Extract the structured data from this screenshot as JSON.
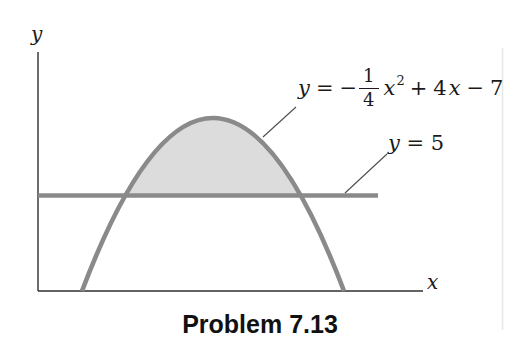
{
  "figure": {
    "caption": "Problem 7.13",
    "axis_labels": {
      "x": "x",
      "y": "y"
    },
    "parabola_label": {
      "lhs": "y",
      "equals": "=",
      "minus": "−",
      "fraction": {
        "numerator": "1",
        "denominator": "4"
      },
      "term_x": "x",
      "exponent": "2",
      "plus": "+",
      "coeff": "4",
      "term_x2": "x",
      "minus2": "−",
      "constant": "7"
    },
    "line_label": {
      "var": "y",
      "rest": " = 5"
    },
    "curves": {
      "parabola_equation": "y = -(1/4)x^2 + 4x - 7",
      "horizontal_line_equation": "y = 5",
      "shaded_region": "area between parabola and line y = 5"
    },
    "colors": {
      "curve_gray": "#8a8a8a",
      "shade_gray": "#dcdcdc",
      "axis_dark": "#2f2f2f",
      "leader_dark": "#4d4d4d",
      "text_dark": "#1a1a1a",
      "scan_edge": "#e8e8e8",
      "background": "#ffffff"
    }
  }
}
